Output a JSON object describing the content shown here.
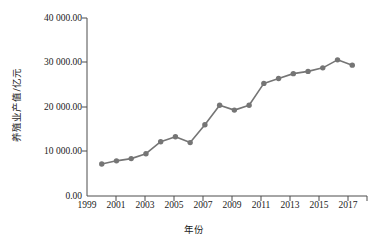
{
  "chart_data": {
    "type": "line",
    "title": "",
    "xlabel": "年份",
    "ylabel": "养殖业产值/亿元",
    "xlim": [
      1999,
      2018
    ],
    "ylim": [
      0,
      40000
    ],
    "grid": false,
    "legend": null,
    "x_tick_labels": [
      "1999",
      "2001",
      "2003",
      "2005",
      "2007",
      "2009",
      "2011",
      "2013",
      "2015",
      "2017"
    ],
    "y_tick_labels": [
      "0.00",
      "10 000.00",
      "20 000.00",
      "30 000.00",
      "40 000.00"
    ],
    "y_tick_values": [
      0,
      10000,
      20000,
      30000,
      40000
    ],
    "series_color": "#757575",
    "marker": "circle",
    "x": [
      2000,
      2001,
      2002,
      2003,
      2004,
      2005,
      2006,
      2007,
      2008,
      2009,
      2010,
      2011,
      2012,
      2013,
      2014,
      2015,
      2016,
      2017
    ],
    "values": [
      7200,
      7900,
      8400,
      9500,
      12200,
      13300,
      12000,
      16000,
      20400,
      19300,
      20400,
      25300,
      26400,
      27500,
      28000,
      28800,
      30600,
      29400
    ],
    "series": [
      {
        "name": "养殖业产值",
        "values": [
          7200,
          7900,
          8400,
          9500,
          12200,
          13300,
          12000,
          16000,
          20400,
          19300,
          20400,
          25300,
          26400,
          27500,
          28000,
          28800,
          30600,
          29400
        ]
      }
    ]
  }
}
